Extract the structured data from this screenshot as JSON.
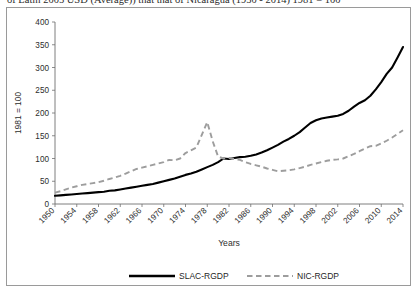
{
  "figure": {
    "caption_partial": "of Latin 2005 USD (Average)) that that of Nicaragua (1950 - 2014) 1981 = 100"
  },
  "axes": {
    "y_title": "1981 = 100",
    "x_title": "Years"
  },
  "legend": {
    "position": "bottom",
    "items": [
      {
        "label": "SLAC-RGDP",
        "style": "solid",
        "color": "#000000"
      },
      {
        "label": "NIC-RGDP",
        "style": "dashed",
        "color": "#9d9d9d"
      }
    ]
  },
  "chart_data": {
    "type": "line",
    "title": "",
    "subtitle": "",
    "xlabel": "Years",
    "ylabel": "1981 = 100",
    "xlim": [
      1950,
      2014
    ],
    "ylim": [
      0,
      400
    ],
    "ytick_step": 50,
    "xtick_step": 4,
    "grid": false,
    "legend_position": "bottom",
    "yticks": [
      0,
      50,
      100,
      150,
      200,
      250,
      300,
      350,
      400
    ],
    "xticks": [
      1950,
      1954,
      1958,
      1962,
      1966,
      1970,
      1974,
      1978,
      1982,
      1986,
      1990,
      1994,
      1998,
      2002,
      2006,
      2010,
      2014
    ],
    "x": [
      1950,
      1951,
      1952,
      1953,
      1954,
      1955,
      1956,
      1957,
      1958,
      1959,
      1960,
      1961,
      1962,
      1963,
      1964,
      1965,
      1966,
      1967,
      1968,
      1969,
      1970,
      1971,
      1972,
      1973,
      1974,
      1975,
      1976,
      1977,
      1978,
      1979,
      1980,
      1981,
      1982,
      1983,
      1984,
      1985,
      1986,
      1987,
      1988,
      1989,
      1990,
      1991,
      1992,
      1993,
      1994,
      1995,
      1996,
      1997,
      1998,
      1999,
      2000,
      2001,
      2002,
      2003,
      2004,
      2005,
      2006,
      2007,
      2008,
      2009,
      2010,
      2011,
      2012,
      2013,
      2014
    ],
    "series": [
      {
        "name": "SLAC-RGDP",
        "color": "#000000",
        "style": "solid",
        "values": [
          18,
          19,
          20,
          21,
          22,
          23,
          24,
          25,
          26,
          27,
          29,
          30,
          32,
          34,
          36,
          38,
          40,
          42,
          44,
          47,
          50,
          53,
          56,
          60,
          64,
          67,
          71,
          76,
          81,
          86,
          92,
          100,
          99,
          101,
          103,
          104,
          106,
          109,
          113,
          118,
          124,
          130,
          137,
          143,
          150,
          158,
          168,
          178,
          184,
          188,
          190,
          192,
          194,
          198,
          205,
          214,
          222,
          228,
          238,
          252,
          268,
          286,
          300,
          322,
          345
        ]
      },
      {
        "name": "NIC-RGDP",
        "color": "#9d9d9d",
        "style": "dashed",
        "values": [
          25,
          28,
          32,
          36,
          39,
          42,
          44,
          46,
          48,
          51,
          55,
          58,
          62,
          67,
          72,
          77,
          80,
          83,
          86,
          89,
          92,
          97,
          96,
          100,
          112,
          118,
          124,
          152,
          180,
          138,
          104,
          100,
          101,
          99,
          97,
          92,
          88,
          85,
          82,
          78,
          75,
          72,
          73,
          74,
          76,
          79,
          82,
          86,
          89,
          92,
          95,
          97,
          98,
          100,
          105,
          110,
          116,
          122,
          127,
          128,
          133,
          139,
          146,
          154,
          162
        ]
      }
    ]
  }
}
